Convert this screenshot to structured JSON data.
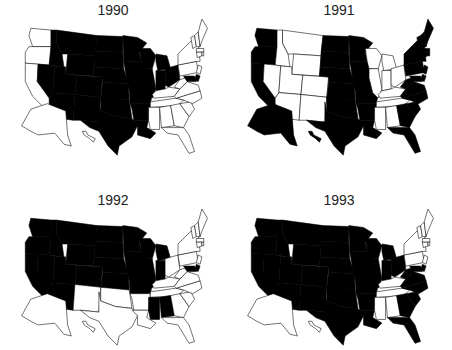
{
  "figure": {
    "panels": [
      {
        "title": "1990",
        "filled": [
          "ID",
          "MT",
          "WY",
          "NV",
          "UT",
          "CO",
          "AZ",
          "NM",
          "ND",
          "SD",
          "NE",
          "KS",
          "OK",
          "TX",
          "MN",
          "IA",
          "MO",
          "AR",
          "LA",
          "WI",
          "IL",
          "MI",
          "IN",
          "OH",
          "DE",
          "MD"
        ]
      },
      {
        "title": "1991",
        "filled": [
          "WA",
          "OR",
          "CA",
          "AK",
          "HI",
          "ND",
          "SD",
          "NE",
          "KS",
          "OK",
          "TX",
          "MN",
          "IA",
          "MO",
          "AR",
          "LA",
          "ME",
          "NH",
          "VT",
          "MA",
          "RI",
          "CT",
          "NY",
          "NJ",
          "PA",
          "DE",
          "MD",
          "WV",
          "VA",
          "NC",
          "SC",
          "GA",
          "FL"
        ]
      },
      {
        "title": "1992",
        "filled": [
          "WA",
          "OR",
          "CA",
          "ID",
          "MT",
          "WY",
          "NV",
          "UT",
          "CO",
          "AZ",
          "ND",
          "SD",
          "NE",
          "KS",
          "MN",
          "IA",
          "MO",
          "WI",
          "IL",
          "MI",
          "IN",
          "MS",
          "AL",
          "DE",
          "MD"
        ]
      },
      {
        "title": "1993",
        "filled": [
          "WA",
          "OR",
          "CA",
          "ID",
          "MT",
          "WY",
          "NV",
          "UT",
          "CO",
          "AZ",
          "NM",
          "ND",
          "SD",
          "NE",
          "KS",
          "OK",
          "TX",
          "MN",
          "IA",
          "MO",
          "AR",
          "LA",
          "WI",
          "IL",
          "MI",
          "IN",
          "OH",
          "WV",
          "VA",
          "NC",
          "SC",
          "GA",
          "FL",
          "DE",
          "MD"
        ]
      }
    ],
    "colors": {
      "filled": "#000000",
      "empty": "#ffffff",
      "stroke": "#000000"
    }
  }
}
